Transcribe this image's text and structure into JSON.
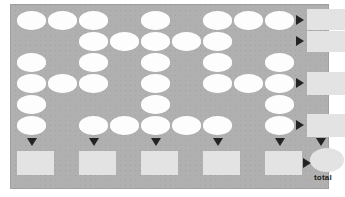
{
  "worksheet": {
    "title": "blank scoring grid worksheet",
    "total_label": "total",
    "panel": {
      "background_color": "#b0b0b0",
      "border_color": "#a0a0a0",
      "x": 10,
      "y": 4,
      "width": 319,
      "height": 185
    },
    "colors": {
      "cell_fill": "#fdfdfd",
      "total_fill": "#e3e3e3",
      "arrow_fill": "#232323",
      "page_background": "#ffffff"
    },
    "geometry": {
      "columns": 9,
      "rows": 6,
      "col_x": [
        16,
        47,
        78,
        109,
        140,
        171,
        202,
        233,
        264
      ],
      "row_y": [
        10,
        31,
        52,
        73,
        94,
        115
      ],
      "cell_width": 29,
      "cell_height": 19
    },
    "grid_cells": [
      {
        "row": 1,
        "cols": [
          1,
          2,
          3,
          5,
          7,
          8,
          9
        ]
      },
      {
        "row": 2,
        "cols": [
          3,
          4,
          5,
          6,
          7
        ]
      },
      {
        "row": 3,
        "cols": [
          1,
          3,
          5,
          7,
          9
        ]
      },
      {
        "row": 4,
        "cols": [
          1,
          2,
          3,
          5,
          7,
          8,
          9
        ]
      },
      {
        "row": 5,
        "cols": [
          1,
          5,
          9
        ]
      },
      {
        "row": 6,
        "cols": [
          1,
          3,
          4,
          5,
          6,
          7,
          9
        ]
      }
    ],
    "row_totals": [
      {
        "row": 1,
        "arrow": "right",
        "value": ""
      },
      {
        "row": 2,
        "arrow": "right",
        "value": ""
      },
      {
        "row": 4,
        "arrow": "right",
        "value": ""
      },
      {
        "row": 6,
        "arrow": "right",
        "value": ""
      }
    ],
    "row_total_boxes": [
      {
        "id": "row-total-1",
        "x": 285,
        "y": 8,
        "width": 38,
        "height": 21,
        "value": ""
      },
      {
        "id": "row-total-2",
        "x": 285,
        "y": 29,
        "width": 38,
        "height": 21,
        "value": ""
      },
      {
        "id": "row-total-4",
        "x": 285,
        "y": 71,
        "width": 38,
        "height": 23,
        "value": ""
      },
      {
        "id": "row-total-6",
        "x": 285,
        "y": 113,
        "width": 38,
        "height": 23,
        "value": ""
      }
    ],
    "column_totals": [
      {
        "col": 1,
        "arrow": "down",
        "value": ""
      },
      {
        "col": 3,
        "arrow": "down",
        "value": ""
      },
      {
        "col": 5,
        "arrow": "down",
        "value": ""
      },
      {
        "col": 6,
        "arrow": "down",
        "value": ""
      },
      {
        "col": 8,
        "arrow": "down",
        "value": ""
      }
    ],
    "column_total_boxes": [
      {
        "id": "col-total-1",
        "x": 16,
        "y": 150,
        "width": 37,
        "height": 24,
        "value": ""
      },
      {
        "id": "col-total-2",
        "x": 74,
        "y": 150,
        "width": 37,
        "height": 24,
        "value": ""
      },
      {
        "id": "col-total-3",
        "x": 132,
        "y": 150,
        "width": 37,
        "height": 24,
        "value": ""
      },
      {
        "id": "col-total-4",
        "x": 190,
        "y": 150,
        "width": 37,
        "height": 24,
        "value": ""
      },
      {
        "id": "col-total-5",
        "x": 248,
        "y": 150,
        "width": 37,
        "height": 24,
        "value": ""
      }
    ],
    "grand_total": {
      "label": "total",
      "value": "",
      "x": 289,
      "y": 147,
      "width": 34,
      "height": 24
    }
  }
}
